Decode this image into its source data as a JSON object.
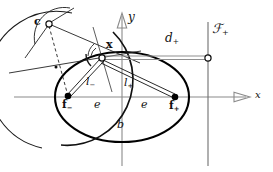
{
  "figure": {
    "kind": "geometry-diagram",
    "background_color": "#ffffff",
    "ink_color": "#111111",
    "gray_color": "#7a7a7a"
  },
  "axes": {
    "x_label": "x",
    "y_label": "y",
    "origin": {
      "x": 122,
      "y": 97
    }
  },
  "labels": {
    "center_point": "c",
    "point_on_ellipse": "x",
    "focus_minus": "f",
    "focus_minus_sub": "−",
    "focus_plus": "f",
    "focus_plus_sub": "+",
    "radius_minus": "l",
    "radius_minus_sub": "−",
    "radius_plus": "l",
    "radius_plus_sub": "+",
    "distance_plus": "d",
    "distance_plus_sub": "+",
    "directrix": "ℱ",
    "directrix_sub": "+",
    "linear_eccentricity_left": "e",
    "linear_eccentricity_right": "e",
    "semi_minor": "b"
  },
  "geometry": {
    "ellipse": {
      "cx": 122,
      "cy": 97,
      "rx": 67,
      "ry": 45
    },
    "focus_minus_point": {
      "x": 68,
      "y": 96
    },
    "focus_plus_point": {
      "x": 175,
      "y": 97
    },
    "point_x": {
      "x": 102,
      "y": 58
    },
    "point_c": {
      "x": 49,
      "y": 24
    },
    "directrix_line_x": 208,
    "directrix_point": {
      "x": 208,
      "y": 58
    },
    "midpoint_marker": {
      "x": 56,
      "y": 67
    }
  }
}
